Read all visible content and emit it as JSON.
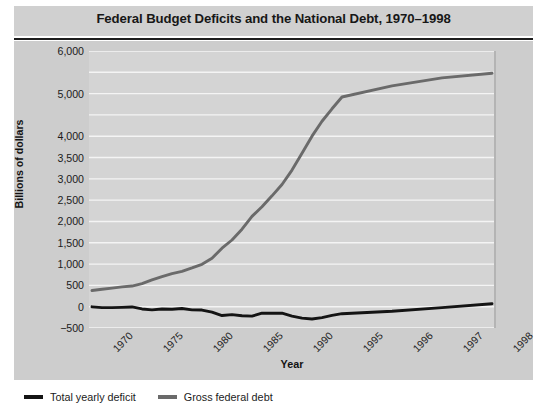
{
  "title": "Federal Budget Deficits and the National Debt, 1970–1998",
  "axes": {
    "ylabel": "Billions of dollars",
    "xlabel": "Year",
    "yticks": [
      "6,000",
      "5,000",
      "4,000",
      "3,500",
      "3,000",
      "2,500",
      "2,000",
      "1,500",
      "1,000",
      "500",
      "0",
      "−500"
    ],
    "xticks": [
      "1970",
      "1975",
      "1980",
      "1985",
      "1990",
      "1995",
      "1996",
      "1997",
      "1998"
    ]
  },
  "legend": [
    {
      "label": "Total yearly deficit",
      "color": "#141414"
    },
    {
      "label": "Gross federal debt",
      "color": "#6a6a6a"
    }
  ],
  "colors": {
    "panel": "#cdcdcd",
    "plot": "#d4d4d4",
    "grid": "#f4f4f4",
    "deficit": "#141414",
    "debt": "#6a6a6a",
    "title_band": "#d0d0d0",
    "rule": "#1d1d1d"
  },
  "chart_data": {
    "type": "line",
    "title": "Federal Budget Deficits and the National Debt, 1970–1998",
    "xlabel": "Year",
    "ylabel": "Billions of dollars",
    "ylim": [
      -500,
      6000
    ],
    "ytick_values": [
      6000,
      5500,
      5000,
      4500,
      4000,
      3500,
      3000,
      2500,
      2000,
      1500,
      1000,
      500,
      0,
      -500
    ],
    "ytick_labels": [
      "6,000",
      "",
      "5,000",
      "",
      "4,000",
      "3,500",
      "3,000",
      "2,500",
      "2,000",
      "1,500",
      "1,000",
      "500",
      "0",
      "−500"
    ],
    "grid": true,
    "legend_position": "below-left",
    "x": [
      1970,
      1971,
      1972,
      1973,
      1974,
      1975,
      1976,
      1977,
      1978,
      1979,
      1980,
      1981,
      1982,
      1983,
      1984,
      1985,
      1986,
      1987,
      1988,
      1989,
      1990,
      1991,
      1992,
      1993,
      1994,
      1995,
      1996,
      1997,
      1998
    ],
    "xtick_values": [
      1970,
      1975,
      1980,
      1985,
      1990,
      1995,
      1996,
      1997,
      1998
    ],
    "xtick_labels": [
      "1970",
      "1975",
      "1980",
      "1985",
      "1990",
      "1995",
      "1996",
      "1997",
      "1998"
    ],
    "series": [
      {
        "name": "Gross federal debt",
        "color": "#6a6a6a",
        "values": [
          381,
          408,
          436,
          466,
          484,
          541,
          629,
          706,
          777,
          829,
          909,
          995,
          1137,
          1372,
          1565,
          1818,
          2120,
          2346,
          2601,
          2868,
          3206,
          3598,
          4002,
          4351,
          4644,
          4921,
          5181,
          5369,
          5478
        ]
      },
      {
        "name": "Total yearly deficit",
        "color": "#141414",
        "values": [
          -3,
          -23,
          -23,
          -15,
          -6,
          -53,
          -74,
          -54,
          -59,
          -41,
          -74,
          -79,
          -128,
          -208,
          -185,
          -212,
          -221,
          -150,
          -155,
          -152,
          -221,
          -269,
          -290,
          -255,
          -203,
          -164,
          -107,
          -22,
          69
        ]
      }
    ]
  }
}
